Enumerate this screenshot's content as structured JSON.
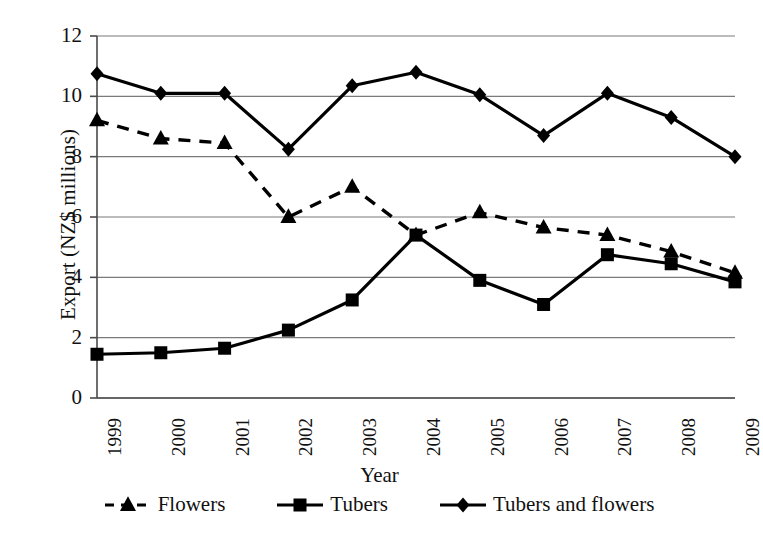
{
  "chart_data": {
    "type": "line",
    "title": "",
    "xlabel": "Year",
    "ylabel": "Export (NZ$ millions)",
    "categories": [
      "1999",
      "2000",
      "2001",
      "2002",
      "2003",
      "2004",
      "2005",
      "2006",
      "2007",
      "2008",
      "2009"
    ],
    "x_tick_labels": [
      "1999",
      "2000",
      "2001",
      "2002",
      "2003",
      "2004",
      "2005",
      "2006",
      "2007",
      "2008",
      "2009"
    ],
    "y_tick_labels": [
      "0",
      "2",
      "4",
      "6",
      "8",
      "10",
      "12"
    ],
    "y_ticks": [
      0,
      2,
      4,
      6,
      8,
      10,
      12
    ],
    "ylim": [
      0,
      12
    ],
    "grid": "horizontal",
    "legend_position": "bottom",
    "series": [
      {
        "name": "Flowers",
        "marker": "triangle",
        "line_style": "dashed",
        "color": "#000000",
        "values": [
          9.2,
          8.6,
          8.45,
          6.0,
          7.0,
          5.4,
          6.15,
          5.65,
          5.4,
          4.85,
          4.15
        ]
      },
      {
        "name": "Tubers",
        "marker": "square",
        "line_style": "solid",
        "color": "#000000",
        "values": [
          1.45,
          1.5,
          1.65,
          2.25,
          3.25,
          5.4,
          3.9,
          3.1,
          4.75,
          4.45,
          3.85
        ]
      },
      {
        "name": "Tubers and flowers",
        "marker": "diamond",
        "line_style": "solid",
        "color": "#000000",
        "values": [
          10.75,
          10.1,
          10.1,
          8.25,
          10.35,
          10.8,
          10.05,
          8.7,
          10.1,
          9.3,
          8.0
        ]
      }
    ]
  },
  "axes": {
    "y_title": "Export (NZ$ millions)",
    "x_title": "Year"
  },
  "legend": {
    "items": [
      {
        "label": "Flowers"
      },
      {
        "label": "Tubers"
      },
      {
        "label": "Tubers and flowers"
      }
    ]
  },
  "colors": {
    "ink": "#000000",
    "grid": "#7a7a7a",
    "axis": "#4a4a4a",
    "background": "#ffffff"
  }
}
